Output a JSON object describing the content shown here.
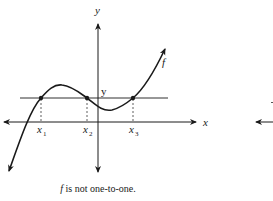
{
  "figure": {
    "axis_labels": {
      "x": "x",
      "y": "y"
    },
    "horizontal_line_label": "y",
    "curve_label": "f",
    "intersection_labels": [
      {
        "base": "x",
        "sub": "1"
      },
      {
        "base": "x",
        "sub": "2"
      },
      {
        "base": "x",
        "sub": "3"
      }
    ],
    "caption_function": "f",
    "caption_text": " is not one-to-one.",
    "colors": {
      "ink": "#1a1a1a",
      "background": "#ffffff"
    }
  }
}
